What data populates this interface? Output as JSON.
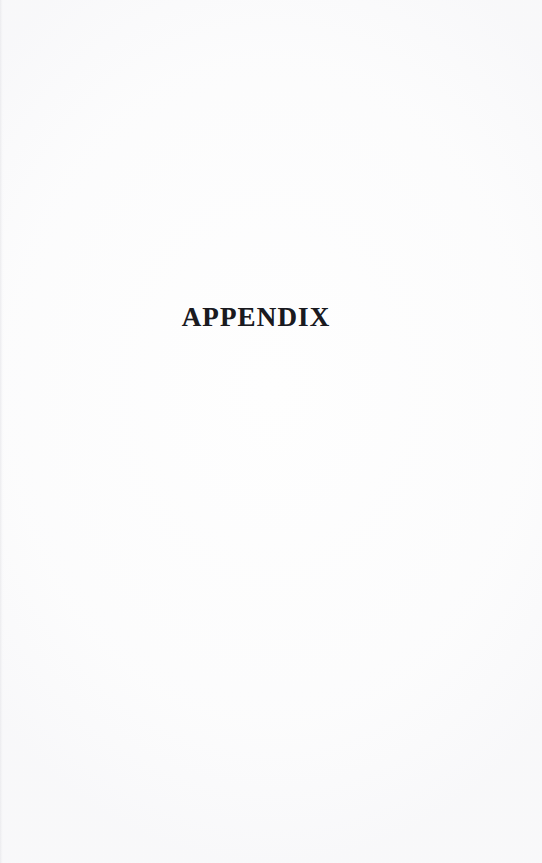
{
  "document": {
    "page_type": "section-divider",
    "page_width": 542,
    "page_height": 863,
    "background_color": "#fefefe",
    "ink_color": "#1a1a1f"
  },
  "content": {
    "heading": "APPENDIX"
  },
  "body": {
    "text": ""
  }
}
